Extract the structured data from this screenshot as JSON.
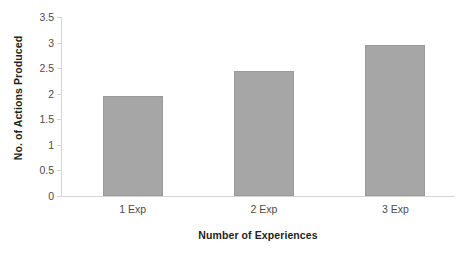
{
  "chart_data": {
    "type": "bar",
    "title": "",
    "categories": [
      "1 Exp",
      "2 Exp",
      "3 Exp"
    ],
    "values": [
      1.95,
      2.45,
      2.95
    ],
    "series": [
      {
        "name": "No. of Actions Produced",
        "values": [
          1.95,
          2.45,
          2.95
        ]
      }
    ],
    "xlabel": "Number of Experiences",
    "ylabel": "No. of Actions Produced",
    "ylim": [
      0,
      3.5
    ],
    "ytick_step": 0.5,
    "yticks": [
      0,
      0.5,
      1,
      1.5,
      2,
      2.5,
      3,
      3.5
    ],
    "ytick_labels": [
      "0",
      "0.5",
      "1",
      "1.5",
      "2",
      "2.5",
      "3",
      "3.5"
    ],
    "grid": false,
    "legend": false,
    "legend_position": "none",
    "bar_color": "#a6a6a6",
    "bar_border_color": "#9a9a9a",
    "axis_color": "#d4d4d4",
    "tick_label_color": "#4d4d4d",
    "axis_title_color": "#231f20",
    "background_color": "#ffffff"
  }
}
